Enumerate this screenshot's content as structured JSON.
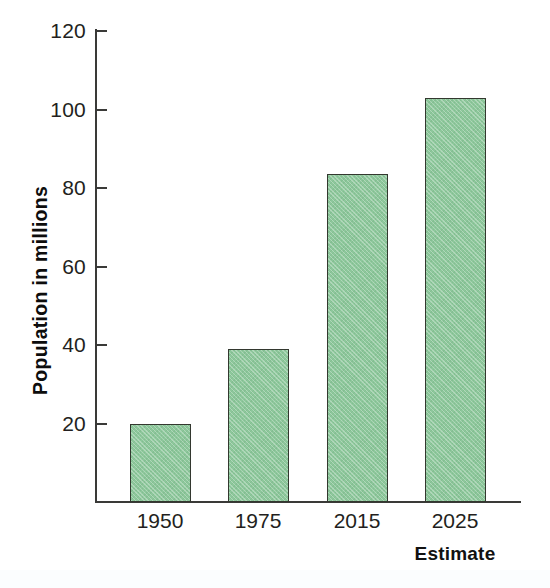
{
  "chart_data": {
    "type": "bar",
    "title": "",
    "subtitle": "",
    "xlabel": "Estimate",
    "ylabel": "Population in millions",
    "categories": [
      "1950",
      "1975",
      "2015",
      "2025"
    ],
    "values": [
      20,
      39,
      83.5,
      103
    ],
    "series": [
      {
        "name": "Population in millions",
        "values": [
          20,
          39,
          83.5,
          103
        ]
      }
    ],
    "ylim": [
      0,
      120
    ],
    "yticks": [
      0,
      20,
      40,
      60,
      80,
      100,
      120
    ],
    "ytick_labels": [
      "",
      "20",
      "40",
      "60",
      "80",
      "100",
      "120"
    ],
    "grid": false,
    "legend": false,
    "legend_position": "none",
    "bar_color": "#8dc79b",
    "bar_edge_color": "#33382f",
    "axis_color": "#3a3a38",
    "text_color": "#231f20"
  },
  "axis": {
    "y_ticks": [
      {
        "label": "120",
        "value": 120
      },
      {
        "label": "100",
        "value": 100
      },
      {
        "label": "80",
        "value": 80
      },
      {
        "label": "60",
        "value": 60
      },
      {
        "label": "40",
        "value": 40
      },
      {
        "label": "20",
        "value": 20
      }
    ],
    "y_title": "Population in millions",
    "x_categories": [
      {
        "label": "1950",
        "value": 20
      },
      {
        "label": "1975",
        "value": 39
      },
      {
        "label": "2015",
        "value": 83.5
      },
      {
        "label": "2025",
        "value": 103
      }
    ],
    "x_note": "Estimate"
  }
}
